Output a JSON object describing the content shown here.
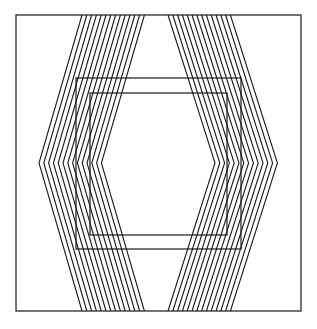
{
  "figure": {
    "width": 317,
    "height": 329,
    "stroke_color": "#1a1a1a",
    "background": "#ffffff",
    "frame": {
      "x1": 16,
      "y1": 15,
      "x2": 301,
      "y2": 311
    },
    "squares": [
      {
        "x1": 76,
        "y1": 78,
        "x2": 241,
        "y2": 249
      },
      {
        "x1": 90,
        "y1": 93,
        "x2": 227,
        "y2": 235
      }
    ],
    "bands": [
      {
        "name": "left-chevron-band",
        "top_x": 82,
        "apex_x": 39,
        "bottom_x": 82,
        "apex_y": 163,
        "count": 14,
        "spacing": 4.8
      },
      {
        "name": "right-chevron-band",
        "top_x": 168,
        "apex_x": 215,
        "bottom_x": 168,
        "apex_y": 163,
        "count": 14,
        "spacing": 4.8
      }
    ]
  }
}
